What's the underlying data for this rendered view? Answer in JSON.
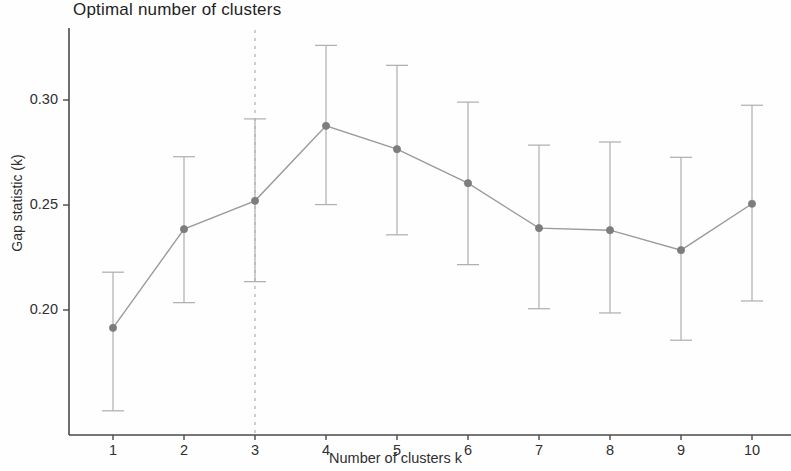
{
  "chart_data": {
    "type": "line",
    "title": "Optimal number of clusters",
    "xlabel": "Number of clusters k",
    "ylabel": "Gap statistic (k)",
    "x": [
      1,
      2,
      3,
      4,
      5,
      6,
      7,
      8,
      9,
      10
    ],
    "values": [
      0.1915,
      0.2385,
      0.252,
      0.2877,
      0.2766,
      0.2604,
      0.239,
      0.238,
      0.2285,
      0.2506
    ],
    "error_low": [
      0.152,
      0.2035,
      0.2135,
      0.2502,
      0.2358,
      0.2216,
      0.2006,
      0.1986,
      0.1856,
      0.2043
    ],
    "error_high": [
      0.218,
      0.273,
      0.291,
      0.326,
      0.3165,
      0.299,
      0.2785,
      0.28,
      0.2727,
      0.2975
    ],
    "errorbars": true,
    "xtick_labels": [
      "1",
      "2",
      "3",
      "4",
      "5",
      "6",
      "7",
      "8",
      "9",
      "10"
    ],
    "ytick_labels": [
      "0.30",
      "0.25",
      "0.20"
    ],
    "ytick_values": [
      0.3,
      0.25,
      0.2
    ],
    "ylim": [
      0.143,
      0.3355
    ],
    "xlim": [
      0.38,
      10.25
    ],
    "grid": false,
    "legend": null,
    "annotations": [
      {
        "name": "optimal-k-dashed-line",
        "type": "vline",
        "x": 3,
        "style": "dashed",
        "color": "#b5b5b5"
      }
    ],
    "series_color": "#9a9a9a",
    "marker_color": "#7d7d7d",
    "marker": "circle"
  },
  "colors": {
    "axis": "#4a4a4a",
    "line": "#9a9a9a",
    "marker": "#7d7d7d",
    "errorbar": "#b0b0b0",
    "dashed": "#bdbdbd",
    "text": "#2f2f2f",
    "background": "#fefefe"
  }
}
